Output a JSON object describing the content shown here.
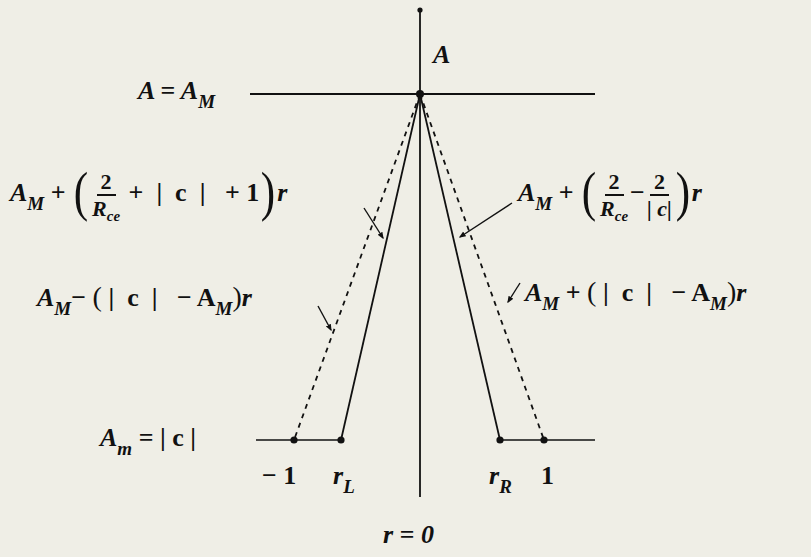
{
  "diagram": {
    "type": "piecewise-linear amplitude diagram",
    "axis_vertical_label": "A",
    "axis_horizontal_label": "r = 0",
    "top_level": {
      "lhs": "A",
      "eq": "=",
      "rhs": "A",
      "rhs_sub": "M"
    },
    "bottom_level": {
      "lhs": "A",
      "lhs_sub": "m",
      "eq": "=",
      "rhs": "| c |"
    },
    "ticks": {
      "neg_one": "− 1",
      "r_L": "r",
      "r_L_sub": "L",
      "r_R": "r",
      "r_R_sub": "R",
      "one": "1"
    },
    "left_solid_label": {
      "base": "A",
      "base_sub": "M",
      "op": "+",
      "frac_num": "2",
      "frac_den": "R",
      "frac_den_sub": "ce",
      "rest": "+  |  c  |   + 1",
      "var": "r"
    },
    "right_solid_label": {
      "base": "A",
      "base_sub": "M",
      "op": "+",
      "frac1_num": "2",
      "frac1_den": "R",
      "frac1_den_sub": "ce",
      "minus": "−",
      "frac2_num": "2",
      "frac2_den": "| c|",
      "var": "r"
    },
    "left_dashed_label": {
      "base": "A",
      "base_sub": "M",
      "op": "−",
      "inner": "|  c  |   − A",
      "inner_sub": "M",
      "var": "r"
    },
    "right_dashed_label": {
      "base": "A",
      "base_sub": "M",
      "op": "+",
      "inner": "|  c  |   − A",
      "inner_sub": "M",
      "var": "r"
    },
    "line_styles": {
      "solid_lines": "apex to r_L and apex to r_R",
      "dashed_lines": "apex to -1 and apex to 1"
    },
    "colors": {
      "ink": "#111111",
      "paper": "#efeee6"
    }
  }
}
